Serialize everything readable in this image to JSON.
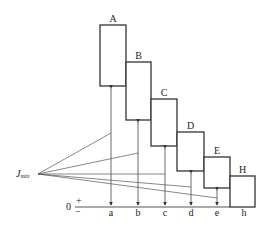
{
  "diagram": {
    "boxes": [
      {
        "label": "A",
        "x": 100,
        "w": 26,
        "top": 25,
        "bottom": 86
      },
      {
        "label": "B",
        "x": 126,
        "w": 25,
        "top": 62,
        "bottom": 120
      },
      {
        "label": "C",
        "x": 151,
        "w": 26,
        "top": 99,
        "bottom": 146
      },
      {
        "label": "D",
        "x": 177,
        "w": 27,
        "top": 132,
        "bottom": 171
      },
      {
        "label": "E",
        "x": 204,
        "w": 26,
        "top": 157,
        "bottom": 188
      },
      {
        "label": "H",
        "x": 230,
        "w": 25,
        "top": 176,
        "bottom": 207
      }
    ],
    "axis_labels": [
      "a",
      "b",
      "c",
      "d",
      "e",
      "h"
    ],
    "zero_label": "0",
    "plus_label": "+",
    "minus_label": "−",
    "apex_label_main": "J",
    "apex_label_sub": "min"
  }
}
